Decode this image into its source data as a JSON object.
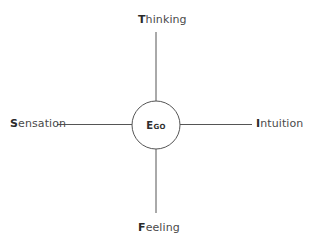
{
  "diagram": {
    "type": "cross-with-center-circle",
    "center": {
      "label": "Ego"
    },
    "axes": {
      "top": {
        "initial": "T",
        "rest": "hinking",
        "label": "Thinking"
      },
      "bottom": {
        "initial": "F",
        "rest": "eeling",
        "label": "Feeling"
      },
      "left": {
        "initial": "S",
        "rest": "ensation",
        "label": "Sensation"
      },
      "right": {
        "initial": "I",
        "rest": "ntuition",
        "label": "Intuition"
      }
    },
    "colors": {
      "line": "#555555",
      "text": "#3a3a3a",
      "background": "#ffffff"
    }
  }
}
